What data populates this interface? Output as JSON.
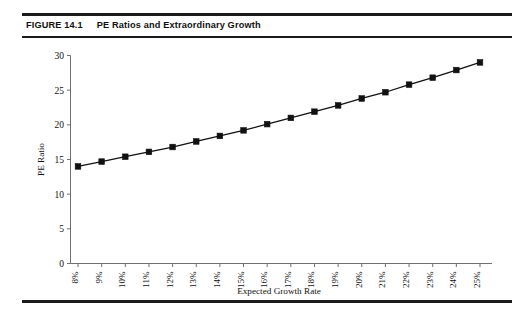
{
  "figure": {
    "number_label": "FIGURE 14.1",
    "caption": "PE Ratios and Extraordinary Growth"
  },
  "chart_data": {
    "type": "line",
    "title": "PE Ratios and Extraordinary Growth",
    "subtitle": "",
    "xlabel": "Expected Growth Rate",
    "ylabel": "PE Ratio",
    "categories": [
      "8%",
      "9%",
      "10%",
      "11%",
      "12%",
      "13%",
      "14%",
      "15%",
      "16%",
      "17%",
      "18%",
      "19%",
      "20%",
      "21%",
      "22%",
      "23%",
      "24%",
      "25%"
    ],
    "values": [
      14.0,
      14.7,
      15.4,
      16.1,
      16.8,
      17.6,
      18.4,
      19.2,
      20.1,
      21.0,
      21.9,
      22.8,
      23.8,
      24.7,
      25.8,
      26.8,
      27.9,
      29.0
    ],
    "series": [
      {
        "name": "PE Ratio",
        "values": [
          14.0,
          14.7,
          15.4,
          16.1,
          16.8,
          17.6,
          18.4,
          19.2,
          20.1,
          21.0,
          21.9,
          22.8,
          23.8,
          24.7,
          25.8,
          26.8,
          27.9,
          29.0
        ]
      }
    ],
    "ylim": [
      0,
      30
    ],
    "yticks": [
      0,
      5,
      10,
      15,
      20,
      25,
      30
    ],
    "ytick_labels": [
      "0",
      "5",
      "10",
      "15",
      "20",
      "25",
      "30"
    ],
    "grid": false,
    "legend": false,
    "legend_position": "none",
    "marker": "square",
    "line_color": "#111111",
    "marker_color": "#111111",
    "axis_color": "#6f6f6f",
    "background_color": "#ffffff"
  }
}
